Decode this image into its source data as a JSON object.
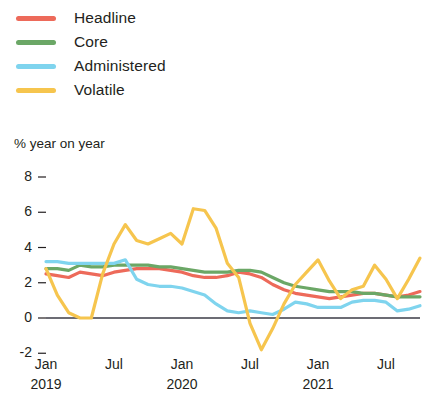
{
  "chart_data": {
    "type": "line",
    "title": "",
    "subtitle": "",
    "xlabel": "",
    "ylabel": "% year on year",
    "ylim": [
      -2,
      8
    ],
    "yticks": [
      8,
      6,
      4,
      2,
      0,
      -2
    ],
    "ytick_labels": [
      "8",
      "6",
      "4",
      "2",
      "0",
      "-2"
    ],
    "grid": false,
    "zero_line": true,
    "legend_position": "top-left",
    "x": [
      "Jan 2019",
      "Feb 2019",
      "Mar 2019",
      "Apr 2019",
      "May 2019",
      "Jun 2019",
      "Jul 2019",
      "Aug 2019",
      "Sep 2019",
      "Oct 2019",
      "Nov 2019",
      "Dec 2019",
      "Jan 2020",
      "Feb 2020",
      "Mar 2020",
      "Apr 2020",
      "May 2020",
      "Jun 2020",
      "Jul 2020",
      "Aug 2020",
      "Sep 2020",
      "Oct 2020",
      "Nov 2020",
      "Dec 2020",
      "Jan 2021",
      "Feb 2021",
      "Mar 2021",
      "Apr 2021",
      "May 2021",
      "Jun 2021",
      "Jul 2021",
      "Aug 2021",
      "Sep 2021",
      "Oct 2021"
    ],
    "xtick_positions": [
      "Jan 2019",
      "Jul 2019",
      "Jan 2020",
      "Jul 2020",
      "Jan 2021",
      "Jul 2021"
    ],
    "xtick_months": [
      "Jan",
      "Jul",
      "Jan",
      "Jul",
      "Jan",
      "Jul"
    ],
    "xtick_years": [
      "2019",
      "",
      "2020",
      "",
      "2021",
      ""
    ],
    "series": [
      {
        "name": "Headline",
        "color": "#ED6A5A",
        "values": [
          2.5,
          2.4,
          2.3,
          2.6,
          2.5,
          2.4,
          2.6,
          2.7,
          2.8,
          2.8,
          2.8,
          2.7,
          2.6,
          2.4,
          2.3,
          2.3,
          2.4,
          2.6,
          2.5,
          2.3,
          1.9,
          1.6,
          1.4,
          1.3,
          1.2,
          1.1,
          1.2,
          1.3,
          1.4,
          1.4,
          1.3,
          1.2,
          1.3,
          1.5
        ]
      },
      {
        "name": "Core",
        "color": "#6BA766",
        "values": [
          2.8,
          2.8,
          2.7,
          3.0,
          2.9,
          2.9,
          3.0,
          3.0,
          3.0,
          3.0,
          2.9,
          2.9,
          2.8,
          2.7,
          2.6,
          2.6,
          2.6,
          2.7,
          2.7,
          2.6,
          2.3,
          2.0,
          1.8,
          1.7,
          1.6,
          1.5,
          1.5,
          1.5,
          1.4,
          1.4,
          1.3,
          1.2,
          1.2,
          1.2
        ]
      },
      {
        "name": "Administered",
        "color": "#7FD4EE",
        "values": [
          3.2,
          3.2,
          3.1,
          3.1,
          3.1,
          3.1,
          3.1,
          3.3,
          2.2,
          1.9,
          1.8,
          1.8,
          1.7,
          1.5,
          1.3,
          0.8,
          0.4,
          0.3,
          0.4,
          0.3,
          0.2,
          0.5,
          0.9,
          0.8,
          0.6,
          0.6,
          0.6,
          0.9,
          1.0,
          1.0,
          0.9,
          0.4,
          0.5,
          0.7
        ]
      },
      {
        "name": "Volatile",
        "color": "#F6C54E",
        "values": [
          2.8,
          1.3,
          0.3,
          0.0,
          0.0,
          2.5,
          4.2,
          5.3,
          4.4,
          4.2,
          4.5,
          4.8,
          4.2,
          6.2,
          6.1,
          5.1,
          3.1,
          2.3,
          -0.3,
          -1.8,
          -0.6,
          0.8,
          1.9,
          2.6,
          3.3,
          2.1,
          1.1,
          1.6,
          1.8,
          3.0,
          2.2,
          1.1,
          2.2,
          3.4
        ]
      }
    ]
  },
  "legend": {
    "items": [
      {
        "label": "Headline",
        "color": "#ED6A5A"
      },
      {
        "label": "Core",
        "color": "#6BA766"
      },
      {
        "label": "Administered",
        "color": "#7FD4EE"
      },
      {
        "label": "Volatile",
        "color": "#F6C54E"
      }
    ]
  },
  "axis": {
    "y_title": "% year on year"
  }
}
